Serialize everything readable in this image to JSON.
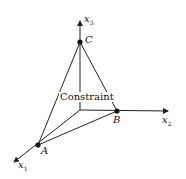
{
  "diagram": {
    "axes": [
      {
        "name": "x1",
        "label": "x",
        "sub": "1"
      },
      {
        "name": "x2",
        "label": "x",
        "sub": "2"
      },
      {
        "name": "x3",
        "label": "x",
        "sub": "3"
      }
    ],
    "points": [
      {
        "name": "A",
        "label": "A"
      },
      {
        "name": "B",
        "label": "B"
      },
      {
        "name": "C",
        "label": "C"
      }
    ],
    "region_label": "Constraint",
    "colors": {
      "line": "#222222",
      "background": "#ffffff"
    }
  }
}
